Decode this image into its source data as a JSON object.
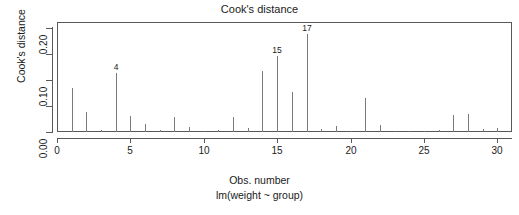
{
  "chart_data": {
    "type": "bar",
    "title": "Cook's distance",
    "xlabel": "Obs. number",
    "sub_xlabel": "lm(weight ~ group)",
    "ylabel": "Cook's distance",
    "grid": false,
    "legend": "none",
    "xlim": [
      0,
      31
    ],
    "ylim": [
      0.0,
      0.215
    ],
    "x_ticks": [
      0,
      5,
      10,
      15,
      20,
      25,
      30
    ],
    "x_tick_labels": [
      "0",
      "5",
      "10",
      "15",
      "20",
      "25",
      "30"
    ],
    "y_ticks": [
      0.0,
      0.05,
      0.1,
      0.15,
      0.2
    ],
    "y_tick_labels": [
      "0.00",
      "",
      "0.10",
      "",
      "0.20"
    ],
    "x": [
      1,
      2,
      3,
      4,
      5,
      6,
      7,
      8,
      9,
      10,
      11,
      12,
      13,
      14,
      15,
      16,
      17,
      18,
      19,
      20,
      21,
      22,
      23,
      24,
      25,
      26,
      27,
      28,
      29,
      30
    ],
    "values": [
      0.085,
      0.038,
      0.004,
      0.113,
      0.031,
      0.016,
      0.003,
      0.029,
      0.009,
      0.002,
      0.003,
      0.029,
      0.007,
      0.118,
      0.147,
      0.077,
      0.189,
      0.005,
      0.012,
      0.002,
      0.065,
      0.014,
      0.002,
      0.002,
      0.002,
      0.004,
      0.033,
      0.035,
      0.005,
      0.008
    ],
    "annotations": [
      {
        "x": 4,
        "label": "4",
        "y": 0.113
      },
      {
        "x": 15,
        "label": "15",
        "y": 0.147
      },
      {
        "x": 17,
        "label": "17",
        "y": 0.189
      }
    ],
    "colors": {
      "spike": "#7a7a7a",
      "axis": "#595959",
      "text": "#1a1a1a",
      "background": "#ffffff"
    }
  }
}
